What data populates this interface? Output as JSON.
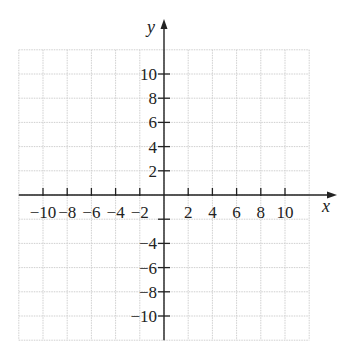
{
  "chart_data": {
    "type": "scatter",
    "title": "",
    "xlabel": "x",
    "ylabel": "y",
    "xlim": [
      -12,
      12
    ],
    "ylim": [
      -12,
      12
    ],
    "grid": true,
    "grid_step": 2,
    "x_ticks": [
      -10,
      -8,
      -6,
      -4,
      -2,
      2,
      4,
      6,
      8,
      10
    ],
    "x_tick_labels": [
      "−10",
      "−8",
      "−6",
      "−4",
      "−2",
      "2",
      "4",
      "6",
      "8",
      "10"
    ],
    "y_ticks": [
      10,
      8,
      6,
      4,
      2,
      -2,
      -4,
      -6,
      -8,
      -10
    ],
    "y_tick_labels": [
      "10",
      "8",
      "6",
      "4",
      "2",
      "",
      "−4",
      "−6",
      "−8",
      "−10"
    ],
    "series": []
  },
  "colors": {
    "axis": "#222222",
    "grid": "#cfcfcf",
    "background": "#ffffff"
  }
}
